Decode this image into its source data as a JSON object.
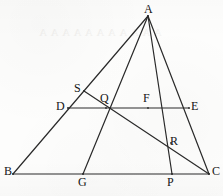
{
  "figure": {
    "background_color": "#fdfdfc",
    "stroke_color": "#2a2a2a",
    "label_color": "#151515",
    "width": 223,
    "height": 196,
    "ghost_text": "A A A A A A A A A A A",
    "vertices": [
      {
        "id": "A",
        "label": "A",
        "x": 148.0,
        "y": 16.0,
        "label_x": 144.0,
        "label_y": 3.0
      },
      {
        "id": "B",
        "label": "B",
        "x": 13.0,
        "y": 174.0,
        "label_x": 4.0,
        "label_y": 165.0
      },
      {
        "id": "C",
        "label": "C",
        "x": 209.0,
        "y": 174.0,
        "label_x": 212.0,
        "label_y": 165.0
      },
      {
        "id": "D",
        "label": "D",
        "x": 68.0,
        "y": 108.0,
        "label_x": 56.0,
        "label_y": 100.0
      },
      {
        "id": "E",
        "label": "E",
        "x": 189.0,
        "y": 108.0,
        "label_x": 191.0,
        "label_y": 100.0
      },
      {
        "id": "S",
        "label": "S",
        "x": 84.0,
        "y": 91.0,
        "label_x": 74.0,
        "label_y": 82.0
      },
      {
        "id": "Q",
        "label": "Q",
        "x": 106.0,
        "y": 108.0,
        "label_x": 100.0,
        "label_y": 92.0
      },
      {
        "id": "F",
        "label": "F",
        "x": 148.0,
        "y": 108.0,
        "label_x": 143.0,
        "label_y": 92.0
      },
      {
        "id": "R",
        "label": "R",
        "x": 171.0,
        "y": 143.0,
        "label_x": 170.0,
        "label_y": 135.0
      },
      {
        "id": "G",
        "label": "G",
        "x": 83.0,
        "y": 174.0,
        "label_x": 78.0,
        "label_y": 176.0
      },
      {
        "id": "P",
        "label": "P",
        "x": 172.0,
        "y": 174.0,
        "label_x": 167.0,
        "label_y": 176.0
      }
    ],
    "segments": [
      {
        "name": "side-AB",
        "from": "A",
        "to": "B",
        "width": 1.2
      },
      {
        "name": "side-BC",
        "from": "B",
        "to": "C",
        "width": 1.2
      },
      {
        "name": "side-AC",
        "from": "A",
        "to": "C",
        "width": 1.2
      },
      {
        "name": "cevian-AG",
        "from": "A",
        "to": "G",
        "width": 1.2
      },
      {
        "name": "cevian-AP",
        "from": "A",
        "to": "P",
        "width": 1.2
      },
      {
        "name": "transversal-DE",
        "from": "D",
        "to": "E",
        "width": 1.2
      },
      {
        "name": "line-SC",
        "from": "S",
        "to": "C",
        "width": 1.2
      }
    ]
  },
  "labels_list": [
    "A",
    "B",
    "C",
    "D",
    "E",
    "S",
    "Q",
    "F",
    "R",
    "G",
    "P"
  ]
}
